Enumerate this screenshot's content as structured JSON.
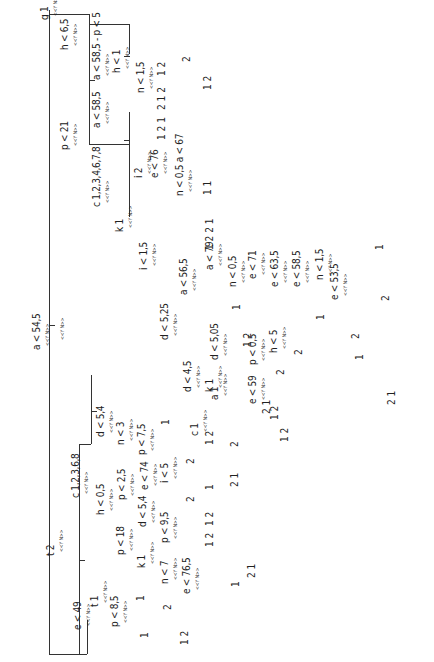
{
  "diagram": {
    "type": "decision-tree",
    "orientation": "rotated-90",
    "branch_marker": "<<Y N>>",
    "lines": [
      [
        49,
        10,
        1,
        644
      ],
      [
        49,
        325,
        6,
        1
      ],
      [
        49,
        14,
        40,
        1
      ],
      [
        89,
        14,
        1,
        130
      ],
      [
        89,
        80,
        6,
        1
      ],
      [
        89,
        24,
        40,
        1
      ],
      [
        129,
        24,
        1,
        30
      ],
      [
        124,
        56,
        6,
        1
      ],
      [
        89,
        144,
        40,
        1
      ],
      [
        129,
        112,
        1,
        105
      ],
      [
        124,
        140,
        6,
        1
      ],
      [
        49,
        654,
        30,
        1
      ],
      [
        79,
        444,
        1,
        210
      ],
      [
        79,
        560,
        6,
        1
      ],
      [
        79,
        444,
        12,
        1
      ],
      [
        91,
        375,
        1,
        69
      ],
      [
        91,
        411,
        6,
        1
      ],
      [
        79,
        654,
        8,
        1
      ],
      [
        87,
        620,
        1,
        34
      ]
    ],
    "labels": [
      {
        "text": "a < 54,5",
        "x": 32,
        "y": 350
      },
      {
        "text": "<<Y N>>",
        "x": 60,
        "y": 340,
        "yn": true
      },
      {
        "text": "g 1",
        "x": 40,
        "y": 20
      },
      {
        "text": "p < 21",
        "x": 60,
        "y": 150
      },
      {
        "text": "h < 6,5",
        "x": 60,
        "y": 50
      },
      {
        "text": "c 1,2,3,4,6,7,8",
        "x": 92,
        "y": 207
      },
      {
        "text": "a < 58,5",
        "x": 92,
        "y": 128
      },
      {
        "text": "a < 58,5 - p < 5",
        "x": 92,
        "y": 80
      },
      {
        "text": "h < 1",
        "x": 112,
        "y": 73
      },
      {
        "text": "n < 1,5",
        "x": 136,
        "y": 93
      },
      {
        "text": "k 1",
        "x": 115,
        "y": 232
      },
      {
        "text": "i 2",
        "x": 134,
        "y": 178
      },
      {
        "text": "e < 76",
        "x": 150,
        "y": 178
      },
      {
        "text": "n < 0,5 a < 67",
        "x": 175,
        "y": 196
      },
      {
        "text": "i < 1,5",
        "x": 139,
        "y": 270
      },
      {
        "text": "d < 5,25",
        "x": 160,
        "y": 340
      },
      {
        "text": "a < 56,5",
        "x": 179,
        "y": 295
      },
      {
        "text": "a < 79",
        "x": 205,
        "y": 270
      },
      {
        "text": "n < 0,5",
        "x": 228,
        "y": 287
      },
      {
        "text": "e < 71",
        "x": 248,
        "y": 279
      },
      {
        "text": "e < 63,5",
        "x": 270,
        "y": 287
      },
      {
        "text": "e < 58,5",
        "x": 292,
        "y": 287
      },
      {
        "text": "n < 1,5",
        "x": 315,
        "y": 280
      },
      {
        "text": "e < 53,5",
        "x": 330,
        "y": 300
      },
      {
        "text": "d < 4,5",
        "x": 183,
        "y": 392
      },
      {
        "text": "c 1",
        "x": 190,
        "y": 436
      },
      {
        "text": "k 1",
        "x": 205,
        "y": 392
      },
      {
        "text": "d < 5,05",
        "x": 210,
        "y": 360
      },
      {
        "text": "a 1",
        "x": 210,
        "y": 400
      },
      {
        "text": "e < 59",
        "x": 248,
        "y": 404
      },
      {
        "text": "p < 0,5",
        "x": 248,
        "y": 365
      },
      {
        "text": "h < 5",
        "x": 269,
        "y": 353
      },
      {
        "text": "t 2",
        "x": 46,
        "y": 556
      },
      {
        "text": "c 1,2,3,6,8",
        "x": 71,
        "y": 498
      },
      {
        "text": "h < 0,5",
        "x": 96,
        "y": 515
      },
      {
        "text": "d < 5,4",
        "x": 96,
        "y": 437
      },
      {
        "text": "n < 3",
        "x": 116,
        "y": 445
      },
      {
        "text": "p < 7,5",
        "x": 137,
        "y": 455
      },
      {
        "text": "p < 18",
        "x": 116,
        "y": 555
      },
      {
        "text": "p < 2,5",
        "x": 117,
        "y": 500
      },
      {
        "text": "e < 74",
        "x": 140,
        "y": 490
      },
      {
        "text": "i < 5",
        "x": 160,
        "y": 483
      },
      {
        "text": "k 1",
        "x": 137,
        "y": 568
      },
      {
        "text": "d < 5,4",
        "x": 138,
        "y": 527
      },
      {
        "text": "n < 7",
        "x": 160,
        "y": 584
      },
      {
        "text": "p < 9,5",
        "x": 160,
        "y": 543
      },
      {
        "text": "e < 76,5",
        "x": 182,
        "y": 594
      },
      {
        "text": "e < 49",
        "x": 73,
        "y": 630
      },
      {
        "text": "t 1",
        "x": 90,
        "y": 607
      },
      {
        "text": "p < 8,5",
        "x": 110,
        "y": 627
      }
    ],
    "leaves": [
      {
        "text": "1 2",
        "x": 157,
        "y": 76
      },
      {
        "text": "2 1 2",
        "x": 157,
        "y": 110
      },
      {
        "text": "2",
        "x": 182,
        "y": 62
      },
      {
        "text": "1 2",
        "x": 203,
        "y": 90
      },
      {
        "text": "1 2 1",
        "x": 157,
        "y": 140
      },
      {
        "text": "1 1",
        "x": 203,
        "y": 195
      },
      {
        "text": "1 2 2 1",
        "x": 205,
        "y": 250
      },
      {
        "text": "1",
        "x": 232,
        "y": 310
      },
      {
        "text": "1",
        "x": 375,
        "y": 250
      },
      {
        "text": "2",
        "x": 381,
        "y": 301
      },
      {
        "text": "1",
        "x": 316,
        "y": 320
      },
      {
        "text": "2",
        "x": 351,
        "y": 339
      },
      {
        "text": "1",
        "x": 355,
        "y": 360
      },
      {
        "text": "2 1",
        "x": 387,
        "y": 405
      },
      {
        "text": "1 2",
        "x": 243,
        "y": 347
      },
      {
        "text": "2",
        "x": 294,
        "y": 355
      },
      {
        "text": "2",
        "x": 276,
        "y": 375
      },
      {
        "text": "2 1",
        "x": 262,
        "y": 414
      },
      {
        "text": "2",
        "x": 230,
        "y": 447
      },
      {
        "text": "1 2",
        "x": 270,
        "y": 420
      },
      {
        "text": "1 2",
        "x": 280,
        "y": 442
      },
      {
        "text": "1",
        "x": 161,
        "y": 425
      },
      {
        "text": "1 2",
        "x": 205,
        "y": 445
      },
      {
        "text": "2",
        "x": 186,
        "y": 464
      },
      {
        "text": "1",
        "x": 205,
        "y": 490
      },
      {
        "text": "2 1",
        "x": 230,
        "y": 487
      },
      {
        "text": "2",
        "x": 186,
        "y": 502
      },
      {
        "text": "1 2",
        "x": 205,
        "y": 526
      },
      {
        "text": "1 2",
        "x": 205,
        "y": 547
      },
      {
        "text": "1",
        "x": 231,
        "y": 587
      },
      {
        "text": "2 1",
        "x": 247,
        "y": 578
      },
      {
        "text": "1",
        "x": 136,
        "y": 601
      },
      {
        "text": "2",
        "x": 163,
        "y": 610
      },
      {
        "text": "1 2",
        "x": 180,
        "y": 645
      },
      {
        "text": "1",
        "x": 140,
        "y": 638
      }
    ]
  }
}
